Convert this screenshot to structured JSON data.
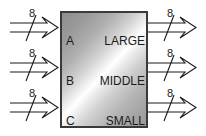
{
  "diagram": {
    "block": {
      "name": "comparator-block",
      "fill_gradient_from": "#8e8e8e",
      "fill_gradient_highlight": "#ffffff",
      "fill_gradient_to": "#9a9a9a",
      "border_color": "#3a3a3a"
    },
    "inputs": [
      {
        "label": "A",
        "bus_width": "8"
      },
      {
        "label": "B",
        "bus_width": "8"
      },
      {
        "label": "C",
        "bus_width": "8"
      }
    ],
    "outputs": [
      {
        "label": "LARGE",
        "bus_width": "8"
      },
      {
        "label": "MIDDLE",
        "bus_width": "8"
      },
      {
        "label": "SMALL",
        "bus_width": "8"
      }
    ]
  }
}
